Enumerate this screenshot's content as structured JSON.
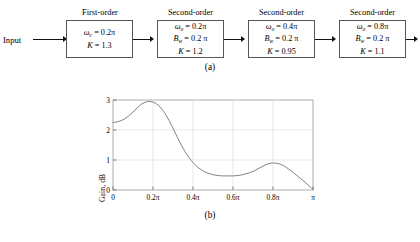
{
  "figure": {
    "caption_a": "(a)",
    "caption_b": "(b)",
    "input_label": "Input"
  },
  "block_diagram": {
    "stages": [
      {
        "title": "First-order",
        "omega_symbol": "ω",
        "omega_sub": "c",
        "omega_eq": "= 0.2π",
        "bw_symbol": "",
        "bw_sub": "",
        "bw_eq": "",
        "k_symbol": "K",
        "k_eq": "= 1.3"
      },
      {
        "title": "Second-order",
        "omega_symbol": "ω",
        "omega_sub": "o",
        "omega_eq": "= 0.2π",
        "bw_symbol": "B",
        "bw_sub": "w",
        "bw_eq": "= 0.2 π",
        "k_symbol": "K",
        "k_eq": "= 1.2"
      },
      {
        "title": "Second-order",
        "omega_symbol": "ω",
        "omega_sub": "o",
        "omega_eq": "= 0.4π",
        "bw_symbol": "B",
        "bw_sub": "w",
        "bw_eq": "= 0.2 π",
        "k_symbol": "K",
        "k_eq": "= 0.95"
      },
      {
        "title": "Second-order",
        "omega_symbol": "ω",
        "omega_sub": "o",
        "omega_eq": "= 0.8π",
        "bw_symbol": "B",
        "bw_sub": "w",
        "bw_eq": "= 0.2 π",
        "k_symbol": "K",
        "k_eq": "= 1.1"
      }
    ]
  },
  "chart_data": {
    "type": "line",
    "title": "",
    "xlabel": "Normalized frequency",
    "ylabel": "Gain, dB",
    "xlim": [
      0,
      3.14159
    ],
    "ylim": [
      0,
      3
    ],
    "grid": true,
    "legend": null,
    "xticks": [
      0,
      0.6283,
      1.2566,
      1.885,
      2.5133,
      3.14159
    ],
    "xticklabels": [
      "0",
      "0.2π",
      "0.4π",
      "0.6π",
      "0.8π",
      "π"
    ],
    "yticks": [
      0,
      1,
      2,
      3
    ],
    "yticklabels": [
      "0",
      "1",
      "2",
      "3"
    ],
    "series": [
      {
        "name": "Cascade gain response",
        "x": [
          0.0,
          0.02,
          0.04,
          0.06,
          0.08,
          0.1,
          0.12,
          0.14,
          0.16,
          0.18,
          0.2,
          0.22,
          0.24,
          0.26,
          0.28,
          0.3,
          0.32,
          0.34,
          0.36,
          0.38,
          0.4,
          0.42,
          0.44,
          0.46,
          0.48,
          0.5,
          0.52,
          0.54,
          0.56,
          0.58,
          0.6,
          0.62,
          0.64,
          0.66,
          0.68,
          0.7,
          0.72,
          0.74,
          0.76,
          0.78,
          0.8,
          0.82,
          0.84,
          0.86,
          0.88,
          0.9,
          0.92,
          0.94,
          0.96,
          0.98,
          1.0
        ],
        "x_units": "fraction of π",
        "y": [
          2.25,
          2.27,
          2.31,
          2.38,
          2.48,
          2.6,
          2.73,
          2.85,
          2.92,
          2.95,
          2.93,
          2.86,
          2.73,
          2.55,
          2.32,
          2.06,
          1.78,
          1.52,
          1.28,
          1.08,
          0.91,
          0.78,
          0.68,
          0.6,
          0.55,
          0.51,
          0.49,
          0.47,
          0.47,
          0.47,
          0.47,
          0.48,
          0.5,
          0.53,
          0.57,
          0.62,
          0.69,
          0.76,
          0.83,
          0.88,
          0.9,
          0.89,
          0.85,
          0.78,
          0.69,
          0.59,
          0.48,
          0.37,
          0.26,
          0.14,
          0.02
        ],
        "y_units": "dB",
        "color": "#777777"
      }
    ],
    "annotations": {
      "peak1": {
        "x": "0.17π",
        "y": 2.95
      },
      "peak2": {
        "x": "0.80π",
        "y": 0.9
      },
      "dc_gain": {
        "x": "0",
        "y": 2.25
      }
    }
  }
}
